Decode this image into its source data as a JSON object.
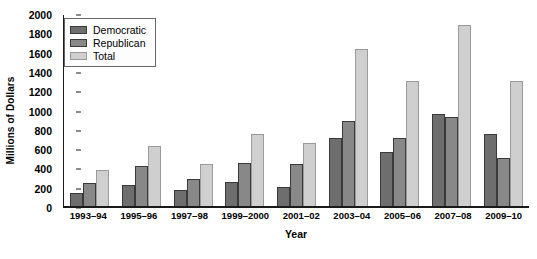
{
  "chart_data": {
    "type": "bar",
    "title": "",
    "xlabel": "Year",
    "ylabel": "Millions of Dollars",
    "ylim": [
      0,
      2000
    ],
    "yticks": [
      0,
      200,
      400,
      600,
      800,
      1000,
      1200,
      1400,
      1600,
      1800,
      2000
    ],
    "grid": false,
    "legend_position": "top-left",
    "categories": [
      "1993–94",
      "1995–96",
      "1997–98",
      "1999–2000",
      "2001–02",
      "2003–04",
      "2005–06",
      "2007–08",
      "2009–10"
    ],
    "series": [
      {
        "name": "Democratic",
        "color": "#6e6e6e",
        "values": [
          130,
          215,
          165,
          250,
          200,
          700,
          560,
          950,
          750
        ]
      },
      {
        "name": "Republican",
        "color": "#888888",
        "values": [
          235,
          415,
          280,
          450,
          440,
          880,
          700,
          920,
          500
        ]
      },
      {
        "name": "Total",
        "color": "#cfcfcf",
        "values": [
          370,
          625,
          440,
          745,
          655,
          1630,
          1300,
          1880,
          1300
        ]
      }
    ]
  }
}
